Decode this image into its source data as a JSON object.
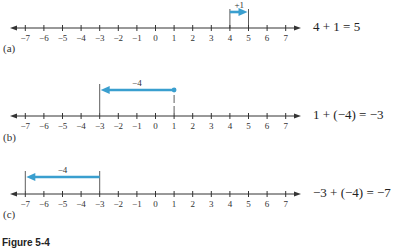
{
  "figure": {
    "caption": "Figure 5-4",
    "accent_color": "#3a9fcf",
    "axis_color": "#333333"
  },
  "panels": [
    {
      "label": "(a)",
      "equation": "4 + 1 = 5",
      "start": 4,
      "step": 1,
      "end": 5,
      "step_label": "+1"
    },
    {
      "label": "(b)",
      "equation": "1 + (−4) = −3",
      "start": 1,
      "step": -4,
      "end": -3,
      "step_label": "−4"
    },
    {
      "label": "(c)",
      "equation": "−3 + (−4) = −7",
      "start": -3,
      "step": -4,
      "end": -7,
      "step_label": "−4"
    }
  ],
  "axis": {
    "ticks": [
      -7,
      -6,
      -5,
      -4,
      -3,
      -2,
      -1,
      0,
      1,
      2,
      3,
      4,
      5,
      6,
      7
    ],
    "tick_labels": [
      "−7",
      "−6",
      "−5",
      "−4",
      "−3",
      "−2",
      "−1",
      "0",
      "1",
      "2",
      "3",
      "4",
      "5",
      "6",
      "7"
    ]
  }
}
